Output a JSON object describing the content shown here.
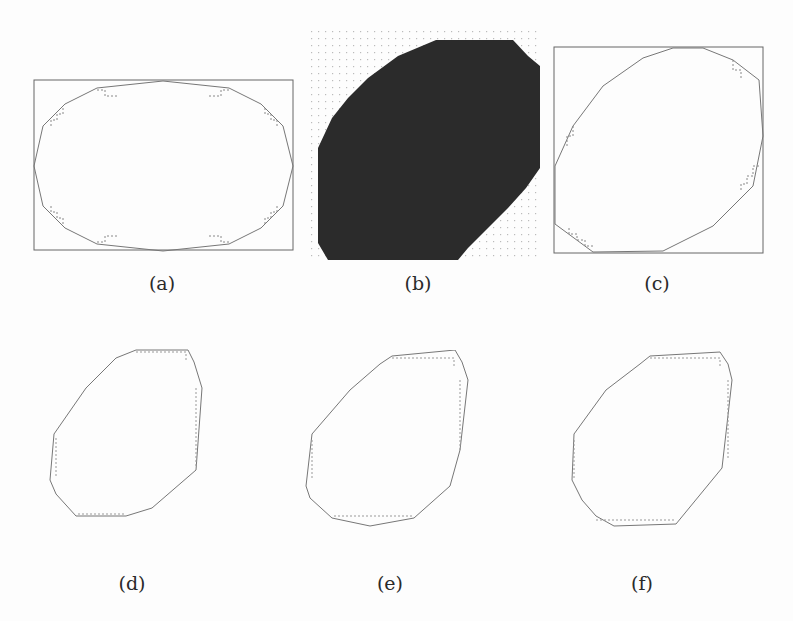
{
  "figure": {
    "panels": [
      {
        "id": "a",
        "label": "(a)",
        "description": "ellipse with digital boundary inside bounding rectangle"
      },
      {
        "id": "b",
        "label": "(b)",
        "description": "pixelated dark tilted ellipse on dotted grid"
      },
      {
        "id": "c",
        "label": "(c)",
        "description": "tilted ellipse with digital boundary inside bounding square"
      },
      {
        "id": "d",
        "label": "(d)",
        "description": "polygonal approximation of tilted digital ellipse"
      },
      {
        "id": "e",
        "label": "(e)",
        "description": "polygonal approximation of tilted digital ellipse"
      },
      {
        "id": "f",
        "label": "(f)",
        "description": "polygonal approximation of tilted digital ellipse"
      }
    ]
  },
  "colors": {
    "line": "#555555",
    "fill_dark": "#2b2b2b",
    "fill_edge": "#6d6d6d",
    "grid": "#c8c8c8"
  }
}
